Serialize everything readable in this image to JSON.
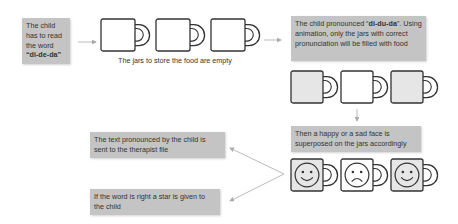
{
  "boxes": {
    "start": {
      "pre": "The  child has to read the word ",
      "word": "“di-de-da”"
    },
    "pronounced": {
      "pre": "The  child pronounced “",
      "word": "di-du-da",
      "post": "”. Using animation, only the jars with correct pronunciation will be filled with food"
    },
    "faces": {
      "text": "Then a happy or a sad face is superposed on the jars accordingly"
    },
    "therapist": {
      "text": "The text pronounced by the child is sent to the therapist file"
    },
    "star": {
      "text": "If the word is right a star is given to the child"
    }
  },
  "captions": {
    "empty_jars": "The jars to store the food are empty"
  },
  "jars": {
    "empty_row": [
      {
        "filled": false
      },
      {
        "filled": false
      },
      {
        "filled": false
      }
    ],
    "filled_row": [
      {
        "filled": true
      },
      {
        "filled": false
      },
      {
        "filled": true
      }
    ],
    "faces_row": [
      {
        "face": "happy"
      },
      {
        "face": "sad"
      },
      {
        "face": "happy"
      }
    ]
  },
  "colors": {
    "box_fill": "#c4c4c4",
    "jar_filled": "#e6e6e6",
    "jar_empty": "#ffffff",
    "stroke": "#333333",
    "arrow": "#aaaaaa"
  }
}
